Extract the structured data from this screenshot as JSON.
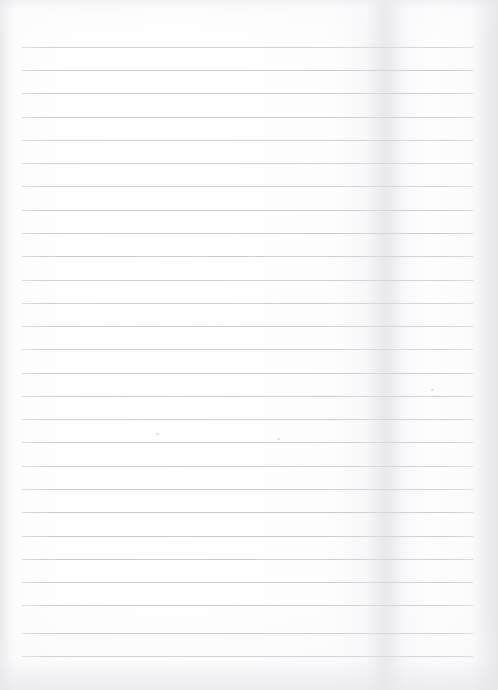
{
  "document": {
    "kind": "scanned-ruled-paper",
    "description": "Blank lined notebook page, scanned",
    "width": 498,
    "height": 690,
    "text_content": "",
    "handwriting": "",
    "printed_text": ""
  },
  "page": {
    "background_color": "#fdfdfd",
    "paper_tint": "#fbfbfc",
    "edge_shadow_color": "#e4e4ea"
  },
  "ruling": {
    "line_color": "#c9c9ce",
    "line_thickness_px": 1,
    "line_count": 27,
    "first_line_y": 47,
    "line_spacing_px": 23.3,
    "left_x": 22,
    "right_x": 473,
    "line_width_px": 451,
    "lines_y": [
      47,
      70,
      93,
      117,
      140,
      163,
      186,
      210,
      233,
      256,
      280,
      303,
      326,
      349,
      373,
      396,
      419,
      442,
      466,
      489,
      512,
      536,
      559,
      582,
      605,
      633,
      656
    ]
  },
  "artifacts": {
    "fold_shadow": {
      "x": 366,
      "width": 40,
      "color": "#d6d6de"
    },
    "specks": [
      {
        "x": 156,
        "y": 433
      },
      {
        "x": 277,
        "y": 438
      },
      {
        "x": 431,
        "y": 389
      }
    ]
  }
}
